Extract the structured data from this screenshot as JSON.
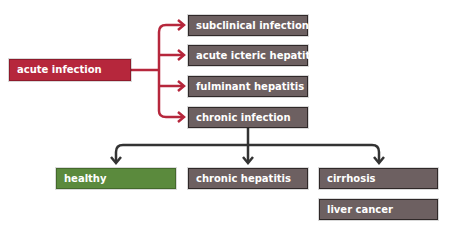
{
  "diagram": {
    "root": {
      "label": "acute infection",
      "color": "#b6273c"
    },
    "outcomes": [
      {
        "label": "subclinical infection"
      },
      {
        "label": "acute icteric hepatitis"
      },
      {
        "label": "fulminant hepatitis"
      },
      {
        "label": "chronic infection"
      }
    ],
    "chronic_outcomes": [
      {
        "label": "healthy",
        "color": "#5b8a3d"
      },
      {
        "label": "chronic hepatitis"
      },
      {
        "label": "cirrhosis"
      },
      {
        "label": "liver cancer"
      }
    ],
    "colors": {
      "box_grey": "#6d6061",
      "arrow_red": "#b6273c",
      "arrow_dark": "#333333",
      "box_green": "#5b8a3d"
    }
  }
}
